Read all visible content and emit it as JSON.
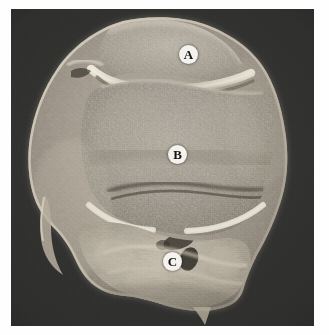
{
  "figure": {
    "kind": "anatomical-cross-section-photograph",
    "caption": "",
    "background_color": "#ffffff",
    "plate_color": "#2e2e2d",
    "specimen_tone_light": "#cfc8bb",
    "specimen_tone_mid": "#9d9487",
    "specimen_tone_dark": "#6b6459",
    "cartilage_highlight": "#e8e2d5"
  },
  "labels": [
    {
      "id": "label-a",
      "text": "A",
      "x": 168,
      "y": 36,
      "region": "patella"
    },
    {
      "id": "label-b",
      "text": "B",
      "x": 157,
      "y": 136,
      "region": "distal-femur-trabecular-bone"
    },
    {
      "id": "label-c",
      "text": "C",
      "x": 152,
      "y": 243,
      "region": "popliteal-soft-tissue"
    }
  ]
}
